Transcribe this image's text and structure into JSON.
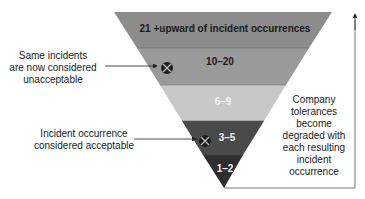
{
  "diagram": {
    "bands": [
      {
        "label": "21 +upward of incident occurrences",
        "color": "#8c8c8c",
        "text_color": "#1a1a1a"
      },
      {
        "label": "10–20",
        "color": "#9a9a9a",
        "text_color": "#1a1a1a"
      },
      {
        "label": "6–9",
        "color": "#c8c8c8",
        "text_color": "#f2f2f2"
      },
      {
        "label": "3–5",
        "color": "#4a4a4a",
        "text_color": "#f0f0f0"
      },
      {
        "label": "1–2",
        "color": "#2e2e2e",
        "text_color": "#f0f0f0"
      }
    ],
    "annotations": {
      "unacceptable": "Same incidents\nare now considered\nunacceptable",
      "acceptable": "Incident occurrence\nconsidered acceptable",
      "tolerance": "Company\ntolerances\nbecome\ndegraded with\neach resulting\nincident\noccurrence"
    },
    "markers": [
      "x-circle-marker",
      "x-circle-marker"
    ]
  }
}
